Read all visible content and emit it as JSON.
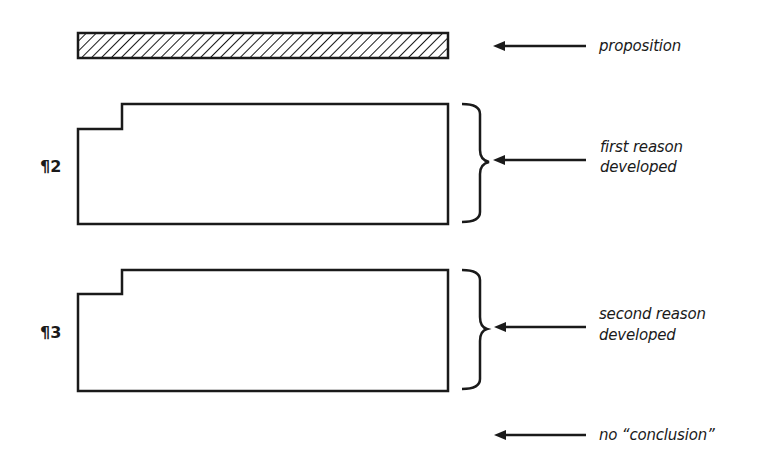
{
  "diagram": {
    "type": "essay-structure",
    "proposition_bar": {
      "label": "proposition",
      "fill": "hatched"
    },
    "paragraphs": [
      {
        "marker": "¶2",
        "label_line1": "first reason",
        "label_line2": "developed"
      },
      {
        "marker": "¶3",
        "label_line1": "second reason",
        "label_line2": "developed"
      }
    ],
    "ending": {
      "label": "no “conclusion”"
    },
    "colors": {
      "ink": "#1a1a1a",
      "background": "#ffffff"
    }
  }
}
